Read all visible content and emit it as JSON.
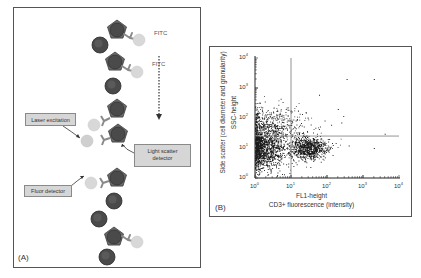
{
  "panel_a": {
    "label": "(A)",
    "annotations": {
      "fitc_1": "FITC",
      "fitc_2": "FITC",
      "laser_excitation": "Laser excitation",
      "light_scatter_detector": "Light scatter detector",
      "fluor_detector": "Fluor detector"
    },
    "colors": {
      "cell_dark": "#4a4a4a",
      "cell_stroke": "#2a2a2a",
      "pentagon": "#6a6a6a",
      "antibody": "#8a8a8a",
      "fluorophore": "#d8d8d8",
      "callout_fill": "#d6d6d6"
    },
    "flow_direction": "down"
  },
  "panel_b": {
    "label": "(B)",
    "x_axis": {
      "label_line1": "FL1-height",
      "label_line2": "CD3+ fluorescence (intensity)",
      "ticks": [
        "10",
        "10",
        "10",
        "10",
        "10"
      ],
      "exponents": [
        "0",
        "1",
        "2",
        "3",
        "4"
      ]
    },
    "y_axis": {
      "label_line1": "Side scatter (cell diameter and granularity)",
      "label_line2": "SSC-height",
      "ticks": [
        "10",
        "10",
        "10",
        "10",
        "10"
      ],
      "exponents": [
        "0",
        "1",
        "2",
        "3",
        "4"
      ]
    }
  },
  "chart_data": {
    "type": "scatter",
    "title": "",
    "xlabel": "FL1-height / CD3+ fluorescence (intensity)",
    "ylabel": "SSC-height / Side scatter (cell diameter and granularity)",
    "xscale": "log",
    "yscale": "log",
    "xlim": [
      1,
      10000
    ],
    "ylim": [
      1,
      10000
    ],
    "x_tick_labels": [
      "10^0",
      "10^1",
      "10^2",
      "10^3",
      "10^4"
    ],
    "y_tick_labels": [
      "10^0",
      "10^1",
      "10^2",
      "10^3",
      "10^4"
    ],
    "quadrant_gates": {
      "vertical_x": 10,
      "horizontal_y": 25
    },
    "clusters": [
      {
        "name": "CD3- population",
        "center_x": 1.5,
        "center_y": 10,
        "spread_log_x": 0.35,
        "spread_log_y": 0.35,
        "approx_points": 1400
      },
      {
        "name": "CD3+ population",
        "center_x": 30,
        "center_y": 10,
        "spread_log_x": 0.25,
        "spread_log_y": 0.18,
        "approx_points": 900
      },
      {
        "name": "scattered high SSC",
        "center_x": 3,
        "center_y": 60,
        "spread_log_x": 0.5,
        "spread_log_y": 0.35,
        "approx_points": 500
      }
    ],
    "outliers": [
      {
        "x": 350,
        "y": 2000
      },
      {
        "x": 2000,
        "y": 2000
      },
      {
        "x": 60,
        "y": 600
      },
      {
        "x": 4000,
        "y": 30
      },
      {
        "x": 2000,
        "y": 10
      },
      {
        "x": 400,
        "y": 12
      },
      {
        "x": 250,
        "y": 70
      },
      {
        "x": 200,
        "y": 200
      },
      {
        "x": 130,
        "y": 60
      }
    ],
    "grid": false,
    "legend": null
  }
}
